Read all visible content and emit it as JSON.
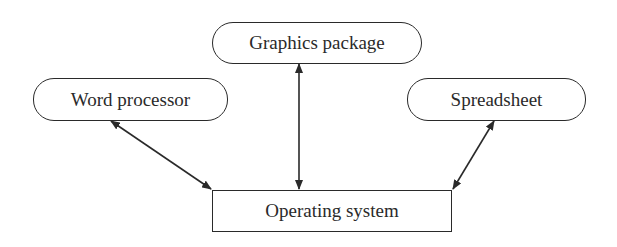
{
  "diagram": {
    "nodes": [
      {
        "id": "graphics",
        "label": "Graphics package",
        "shape": "rounded",
        "x": 212,
        "y": 22,
        "w": 210,
        "h": 42
      },
      {
        "id": "word",
        "label": "Word processor",
        "shape": "rounded",
        "x": 33,
        "y": 78,
        "w": 195,
        "h": 43
      },
      {
        "id": "spreadsheet",
        "label": "Spreadsheet",
        "shape": "rounded",
        "x": 407,
        "y": 78,
        "w": 179,
        "h": 43
      },
      {
        "id": "os",
        "label": "Operating system",
        "shape": "rectangle",
        "x": 212,
        "y": 190,
        "w": 240,
        "h": 42
      }
    ],
    "edges": [
      {
        "from": "word",
        "to": "os",
        "direction": "bidirectional"
      },
      {
        "from": "graphics",
        "to": "os",
        "direction": "bidirectional"
      },
      {
        "from": "spreadsheet",
        "to": "os",
        "direction": "bidirectional"
      }
    ],
    "colors": {
      "stroke": "#2a2a2a",
      "background": "#ffffff",
      "text": "#2a2a2a"
    }
  }
}
